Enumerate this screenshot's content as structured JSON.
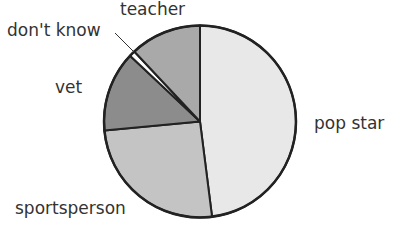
{
  "chart_data": {
    "type": "pie",
    "title": "",
    "start_angle_deg": 0,
    "direction": "clockwise",
    "slices": [
      {
        "label": "pop star",
        "value": 48,
        "color": "#e8e8e8"
      },
      {
        "label": "sportsperson",
        "value": 25.5,
        "color": "#c4c4c4"
      },
      {
        "label": "vet",
        "value": 13.5,
        "color": "#8c8c8c"
      },
      {
        "label": "don't know",
        "value": 1,
        "color": "#ffffff"
      },
      {
        "label": "teacher",
        "value": 12,
        "color": "#a9a9a9"
      }
    ],
    "legend": "none (direct labels)"
  },
  "labels": {
    "pop_star": "pop star",
    "sportsperson": "sportsperson",
    "vet": "vet",
    "dont_know": "don't know",
    "teacher": "teacher"
  }
}
